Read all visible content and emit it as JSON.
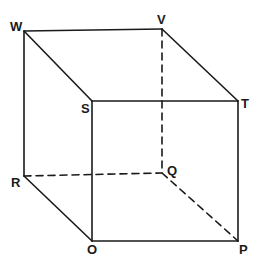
{
  "figure": {
    "kind": "geometry-diagram",
    "shape_name": "cuboid",
    "projection": "oblique",
    "canvas": {
      "width": 262,
      "height": 266
    },
    "background_color": "#ffffff",
    "stroke_color": "#1a1a1a",
    "solid_stroke_width": 1.6,
    "hidden_stroke_width": 1.6,
    "hidden_dash_pattern": "7,5",
    "vertices": [
      {
        "id": "W",
        "label": "W",
        "x": 24,
        "y": 31,
        "label_x": 10,
        "label_y": 20,
        "hidden": false
      },
      {
        "id": "V",
        "label": "V",
        "x": 162,
        "y": 29,
        "label_x": 157,
        "label_y": 13,
        "hidden": false
      },
      {
        "id": "T",
        "label": "T",
        "x": 238,
        "y": 101,
        "label_x": 241,
        "label_y": 97,
        "hidden": false
      },
      {
        "id": "S",
        "label": "S",
        "x": 92,
        "y": 101,
        "label_x": 81,
        "label_y": 102,
        "hidden": false
      },
      {
        "id": "R",
        "label": "R",
        "x": 24,
        "y": 176,
        "label_x": 11,
        "label_y": 176,
        "hidden": true
      },
      {
        "id": "Q",
        "label": "Q",
        "x": 162,
        "y": 173,
        "label_x": 167,
        "label_y": 164,
        "hidden": true
      },
      {
        "id": "O",
        "label": "O",
        "x": 92,
        "y": 241,
        "label_x": 87,
        "label_y": 243,
        "hidden": false
      },
      {
        "id": "P",
        "label": "P",
        "x": 238,
        "y": 241,
        "label_x": 239,
        "label_y": 243,
        "hidden": false
      }
    ],
    "edges": [
      {
        "from": "W",
        "to": "V",
        "style": "solid",
        "name": "edge-w-v"
      },
      {
        "from": "V",
        "to": "T",
        "style": "solid",
        "name": "edge-v-t"
      },
      {
        "from": "W",
        "to": "S",
        "style": "solid",
        "name": "edge-w-s"
      },
      {
        "from": "S",
        "to": "T",
        "style": "solid",
        "name": "edge-s-t"
      },
      {
        "from": "W",
        "to": "R",
        "style": "solid",
        "name": "edge-w-r"
      },
      {
        "from": "T",
        "to": "P",
        "style": "solid",
        "name": "edge-t-p"
      },
      {
        "from": "S",
        "to": "O",
        "style": "solid",
        "name": "edge-s-o"
      },
      {
        "from": "R",
        "to": "O",
        "style": "solid",
        "name": "edge-r-o"
      },
      {
        "from": "O",
        "to": "P",
        "style": "solid",
        "name": "edge-o-p"
      },
      {
        "from": "V",
        "to": "Q",
        "style": "dashed",
        "name": "edge-v-q"
      },
      {
        "from": "R",
        "to": "Q",
        "style": "dashed",
        "name": "edge-r-q"
      },
      {
        "from": "Q",
        "to": "P",
        "style": "dashed",
        "name": "edge-q-p"
      }
    ],
    "faces": {
      "front": [
        "S",
        "T",
        "P",
        "O"
      ],
      "back": [
        "W",
        "V",
        "Q",
        "R"
      ],
      "top": [
        "W",
        "V",
        "T",
        "S"
      ],
      "bottom": [
        "R",
        "Q",
        "P",
        "O"
      ],
      "left": [
        "W",
        "S",
        "O",
        "R"
      ],
      "right": [
        "V",
        "T",
        "P",
        "Q"
      ]
    }
  }
}
